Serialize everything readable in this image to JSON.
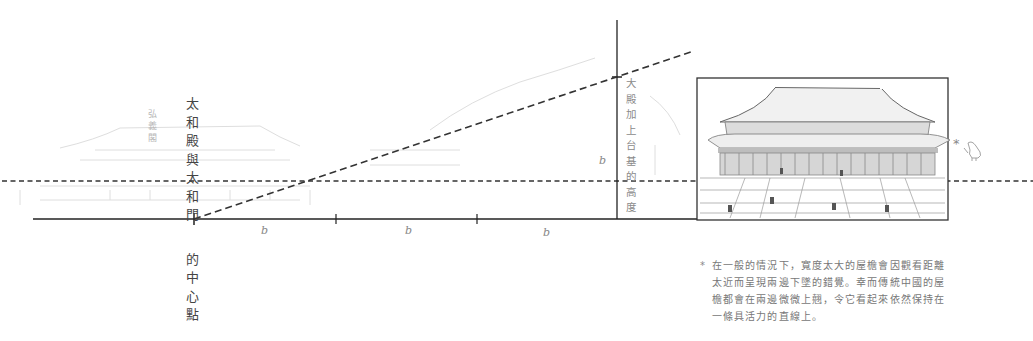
{
  "diagram": {
    "title_label": [
      "太",
      "和",
      "殿",
      "與",
      "太",
      "和",
      "門",
      "的",
      "中",
      "心",
      "點"
    ],
    "title_label_full": "太和殿與太和門的中心點",
    "ghost_label": [
      "弘",
      "義",
      "閣"
    ],
    "ghost_label_full": "弘義閣",
    "height_label": [
      "大",
      "殿",
      "加",
      "上",
      "台",
      "基",
      "的",
      "高",
      "度"
    ],
    "height_label_full": "大殿加上台基的高度",
    "vertical_b_label": "b",
    "segment_labels": [
      "b",
      "b",
      "b"
    ],
    "asterisk": "*",
    "illustration": "太和殿 front elevation sketch",
    "note_star": "*",
    "note_lines": [
      "在一般的情況下，寬度太大的屋檐會因觀看距離",
      "太近而呈現兩邊下墜的錯覺。幸而傳統中國的屋",
      "檐都會在兩邊微微上翹，令它看起來依然保持在",
      "一條具活力的直線上。"
    ],
    "colors": {
      "line": "#222222",
      "dash": "#333333",
      "text": "#444444",
      "faint": "#cfcfcf"
    }
  }
}
